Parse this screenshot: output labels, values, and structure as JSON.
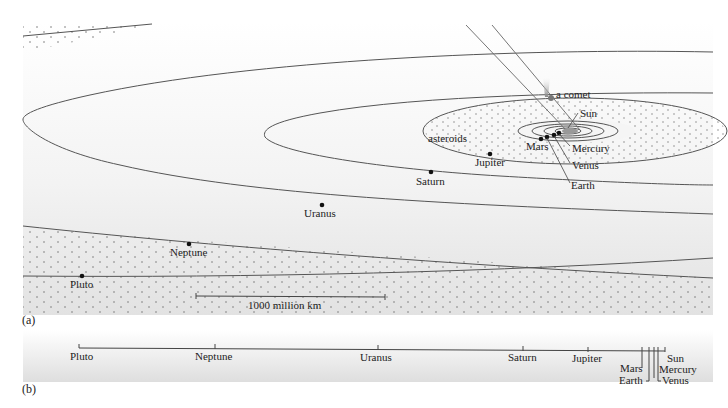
{
  "panel_a": {
    "label": "(a)",
    "planets": [
      {
        "name": "Sun",
        "label": "Sun"
      },
      {
        "name": "Mercury",
        "label": "Mercury"
      },
      {
        "name": "Venus",
        "label": "Venus"
      },
      {
        "name": "Earth",
        "label": "Earth"
      },
      {
        "name": "Mars",
        "label": "Mars"
      },
      {
        "name": "Jupiter",
        "label": "Jupiter"
      },
      {
        "name": "Saturn",
        "label": "Saturn"
      },
      {
        "name": "Uranus",
        "label": "Uranus"
      },
      {
        "name": "Neptune",
        "label": "Neptune"
      },
      {
        "name": "Pluto",
        "label": "Pluto"
      }
    ],
    "asteroids_label": "asteroids",
    "comet_label": "a comet",
    "scale_bar_label": "1000 million km"
  },
  "panel_b": {
    "label": "(b)",
    "scale_labels": [
      "Pluto",
      "Neptune",
      "Uranus",
      "Saturn",
      "Jupiter",
      "Mars",
      "Earth",
      "Sun",
      "Mercury",
      "Venus"
    ]
  }
}
